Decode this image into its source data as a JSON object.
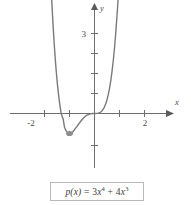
{
  "figure": {
    "caption_formula": "p(x) = 3x⁴ + 4x³",
    "curve_color": "#7a7a7a",
    "axis_color": "#6e6e6e",
    "text_color": "#4a4a4a"
  },
  "axes": {
    "x_axis_label": "x",
    "y_axis_label": "y",
    "x_ticks": [
      {
        "value": -2,
        "label": "-2"
      },
      {
        "value": -1,
        "label": ""
      },
      {
        "value": 1,
        "label": ""
      },
      {
        "value": 2,
        "label": "2"
      }
    ],
    "y_ticks": [
      {
        "value": 1,
        "label": ""
      },
      {
        "value": 2,
        "label": ""
      },
      {
        "value": 3,
        "label": "3"
      },
      {
        "value": 4,
        "label": ""
      },
      {
        "value": -1,
        "label": ""
      }
    ]
  },
  "caption": {
    "p_name": "p",
    "arg": "(x)",
    "equals": " = ",
    "term1_coef": "3",
    "term1_var": "x",
    "term1_exp": "4",
    "plus": " + ",
    "term2_coef": "4",
    "term2_var": "x",
    "term2_exp": "3"
  },
  "chart_data": {
    "type": "line",
    "title": "",
    "subtitle": "",
    "xlabel": "x",
    "ylabel": "y",
    "function": "p(x) = 3x^4 + 4x^3",
    "xlim": [
      -2.6,
      2.6
    ],
    "ylim": [
      -2.2,
      5.2
    ],
    "grid": false,
    "legend": null,
    "annotations": [
      {
        "text": "local minimum",
        "x": -1,
        "y": -1
      },
      {
        "text": "inflection / x-intercept",
        "x": 0,
        "y": 0
      },
      {
        "text": "x-intercept",
        "x": -1.3333,
        "y": 0
      }
    ],
    "x": [
      -1.45,
      -1.4,
      -1.35,
      -1.3333,
      -1.3,
      -1.25,
      -1.2,
      -1.15,
      -1.1,
      -1.05,
      -1.0,
      -0.95,
      -0.9,
      -0.85,
      -0.8,
      -0.75,
      -0.7,
      -0.65,
      -0.6,
      -0.55,
      -0.5,
      -0.45,
      -0.4,
      -0.35,
      -0.3,
      -0.25,
      -0.2,
      -0.15,
      -0.1,
      -0.05,
      0.0,
      0.05,
      0.1,
      0.15,
      0.2,
      0.25,
      0.3,
      0.35,
      0.4,
      0.45,
      0.5,
      0.55,
      0.6,
      0.65,
      0.7,
      0.75,
      0.8,
      0.85,
      0.9
    ],
    "y": [
      1.07,
      0.56,
      0.13,
      0.0,
      -0.12,
      -0.29,
      -0.69,
      -0.84,
      -0.92,
      -0.99,
      -1.0,
      -0.98,
      -0.95,
      -0.89,
      -0.81,
      -0.72,
      -0.65,
      -0.56,
      -0.47,
      -0.39,
      -0.31,
      -0.24,
      -0.18,
      -0.12,
      -0.084,
      -0.051,
      -0.027,
      -0.012,
      -0.0037,
      -0.00048,
      0.0,
      0.00052,
      0.0043,
      0.015,
      0.037,
      0.074,
      0.132,
      0.216,
      0.333,
      0.487,
      0.688,
      0.941,
      1.253,
      1.634,
      2.092,
      2.637,
      3.277,
      4.023,
      4.886
    ],
    "axis_arrows": [
      "x-positive",
      "y-positive"
    ]
  }
}
